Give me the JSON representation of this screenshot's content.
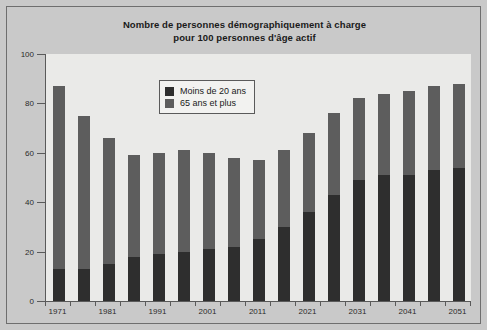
{
  "chart_data": {
    "type": "bar",
    "stacked": true,
    "title": "Nombre de personnes démographiquement à charge pour 100 personnes d'âge actif",
    "title_line1": "Nombre de personnes démographiquement à charge",
    "title_line2": "pour 100 personnes d'âge actif",
    "xlabel": "",
    "ylabel": "",
    "ylim": [
      0,
      100
    ],
    "yticks": [
      0,
      20,
      40,
      60,
      80,
      100
    ],
    "grid": false,
    "legend_position": "top-center",
    "categories": [
      1971,
      1976,
      1981,
      1986,
      1991,
      1996,
      2001,
      2006,
      2011,
      2016,
      2021,
      2026,
      2031,
      2036,
      2041,
      2046,
      2051
    ],
    "xtick_labels": [
      "1971",
      "1981",
      "1991",
      "2001",
      "2011",
      "2021",
      "2031",
      "2041",
      "2051"
    ],
    "xtick_label_categories": [
      1971,
      1981,
      1991,
      2001,
      2011,
      2021,
      2031,
      2041,
      2051
    ],
    "series": [
      {
        "name": "Moins de 20 ans",
        "color": "#2e2e2e",
        "values": [
          13,
          13,
          15,
          18,
          19,
          20,
          21,
          22,
          25,
          30,
          36,
          43,
          49,
          51,
          51,
          53,
          54
        ]
      },
      {
        "name": "65 ans et plus",
        "color": "#5d5d5d",
        "values": [
          74,
          62,
          51,
          41,
          41,
          41,
          39,
          36,
          32,
          31,
          32,
          33,
          33,
          33,
          34,
          34,
          34
        ]
      }
    ],
    "totals": [
      87,
      75,
      66,
      59,
      60,
      61,
      60,
      58,
      57,
      61,
      68,
      76,
      82,
      84,
      85,
      87,
      88
    ]
  },
  "legend": {
    "items": [
      {
        "label": "Moins de 20 ans",
        "color": "#2e2e2e"
      },
      {
        "label": "65 ans et plus",
        "color": "#5d5d5d"
      }
    ]
  }
}
